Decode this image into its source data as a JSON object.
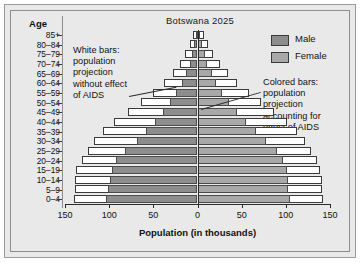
{
  "figure": {
    "title": "Botswana 2025",
    "age_header": "Age",
    "x_axis_title": "Population (in thousands)"
  },
  "legend": {
    "position": "top-right",
    "items": [
      {
        "label": "Male",
        "color": "#8d8d8d",
        "name": "legend-male"
      },
      {
        "label": "Female",
        "color": "#a8a8a8",
        "name": "legend-female"
      }
    ]
  },
  "annotations": [
    {
      "id": "white-bars-note",
      "text": "White bars:\npopulation\nprojection\nwithout effect\nof AIDS"
    },
    {
      "id": "colored-bars-note",
      "text": "Colored bars:\npopulation\nprojection\naccounting for\neffect of AIDS"
    }
  ],
  "chart_data": {
    "type": "bar",
    "subtype": "population-pyramid",
    "title": "Botswana 2025",
    "xlabel": "Population (in thousands)",
    "ylabel": "Age",
    "xlim": [
      -150,
      150
    ],
    "xticks": [
      150,
      100,
      50,
      0,
      50,
      100,
      150
    ],
    "xtick_values": [
      -150,
      -100,
      -50,
      0,
      50,
      100,
      150
    ],
    "grid": false,
    "legend_position": "top-right",
    "categories": [
      "85+",
      "80–84",
      "75–79",
      "70–74",
      "65–69",
      "60–64",
      "55–59",
      "50–54",
      "45–49",
      "40–44",
      "35–39",
      "30–34",
      "25–29",
      "20–24",
      "15–19",
      "10–14",
      "5–9",
      "0–4"
    ],
    "series": [
      {
        "name": "Male (with AIDS)",
        "side": "left",
        "color": "#8d8d8d",
        "values": [
          2,
          4,
          6,
          9,
          13,
          18,
          24,
          31,
          39,
          48,
          58,
          69,
          82,
          92,
          97,
          99,
          101,
          104
        ]
      },
      {
        "name": "Female (with AIDS)",
        "side": "right",
        "color": "#a8a8a8",
        "values": [
          3,
          5,
          8,
          11,
          16,
          21,
          28,
          36,
          45,
          55,
          66,
          78,
          90,
          97,
          101,
          102,
          103,
          105
        ]
      },
      {
        "name": "Male (without AIDS)",
        "side": "left",
        "color": "#ffffff",
        "values": [
          5,
          9,
          14,
          20,
          28,
          38,
          50,
          64,
          79,
          94,
          107,
          117,
          124,
          131,
          137,
          139,
          139,
          140
        ]
      },
      {
        "name": "Female (without AIDS)",
        "side": "right",
        "color": "#ffffff",
        "values": [
          7,
          12,
          18,
          25,
          34,
          45,
          58,
          72,
          87,
          101,
          113,
          122,
          129,
          135,
          139,
          141,
          141,
          142
        ]
      }
    ]
  }
}
